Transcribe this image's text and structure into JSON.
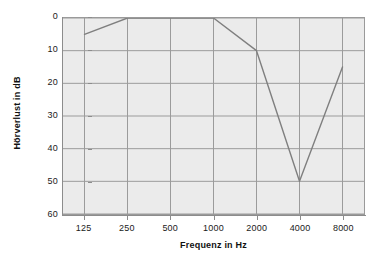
{
  "chart_data": {
    "type": "line",
    "title": "",
    "xlabel": "Frequenz in Hz",
    "ylabel": "Hörverlust in dB",
    "categories": [
      "125",
      "250",
      "500",
      "1000",
      "2000",
      "4000",
      "8000"
    ],
    "series": [
      {
        "name": "Hörverlust",
        "values": [
          5,
          0,
          0,
          0,
          10,
          50,
          15
        ],
        "color": "#7f7f7f"
      }
    ],
    "ylim": [
      0,
      60
    ],
    "y_inverted": true,
    "yticks": [
      "0",
      "10",
      "20",
      "30",
      "40",
      "50",
      "60"
    ],
    "ytick_values": [
      0,
      10,
      20,
      30,
      40,
      50,
      60
    ],
    "grid": true,
    "legend": "none",
    "plot_background": "#ebebeb",
    "gridline_color": "#9a9a9a",
    "axis_color": "#8c8c8c"
  },
  "axes": {
    "y_title": "Hörverlust in dB",
    "x_title": "Frequenz in Hz"
  }
}
